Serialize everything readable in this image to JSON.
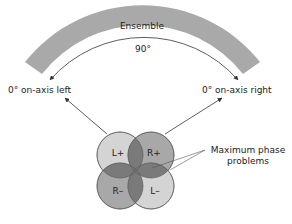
{
  "diagram": {
    "ensemble_label": "Ensemble",
    "angle_label": "90°",
    "left_label": "0° on-axis left",
    "right_label": "0° on-axis right",
    "circles": [
      {
        "id": "L+",
        "label": "L+",
        "shade": "light"
      },
      {
        "id": "R+",
        "label": "R+",
        "shade": "medium"
      },
      {
        "id": "R-",
        "label": "R–",
        "shade": "medium"
      },
      {
        "id": "L-",
        "label": "L–",
        "shade": "light"
      }
    ],
    "annotation_line1": "Maximum phase",
    "annotation_line2": "problems"
  },
  "colors": {
    "band": "#a9a9a9",
    "circle_light": "#d4d4d4",
    "circle_medium": "#a8a8a8",
    "overlap": "#7a7a7a",
    "stroke": "#555555",
    "text": "#222222"
  }
}
